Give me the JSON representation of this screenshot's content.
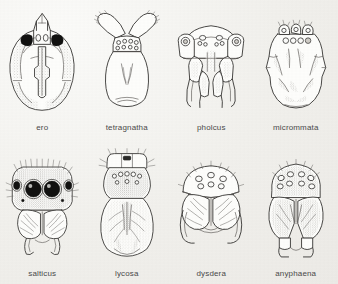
{
  "plate": {
    "title": "Spider carapace frontal views",
    "background_color": "#f2f1ee",
    "ink_color": "#3b3a38",
    "caption_color": "#4a4a4a",
    "columns": 4,
    "rows": 2
  },
  "specimens": [
    {
      "id": "ero",
      "label": "ero",
      "row": 1,
      "column": 1,
      "view": "frontal carapace",
      "eye_marking": "two solid black lateral eye patches flanking four pale central eyes",
      "shading": "stippled lateral margins and median band"
    },
    {
      "id": "tetragnatha",
      "label": "tetragnatha",
      "row": 1,
      "column": 2,
      "view": "frontal carapace with chelicerae",
      "eye_marking": "eight small open circular eyes in two rows",
      "shading": "clean outline, faint median lines"
    },
    {
      "id": "pholcus",
      "label": "pholcus",
      "row": 1,
      "column": 3,
      "view": "frontal carapace with long fangs",
      "eye_marking": "paired raised eye turrets with grouped circles",
      "shading": "light stipple on fangs and clypeus"
    },
    {
      "id": "micrommata",
      "label": "micrommata",
      "row": 1,
      "column": 4,
      "view": "frontal carapace",
      "eye_marking": "four open eyes in a row beneath four raised eyes",
      "shading": "heavy stippled radiating patches"
    },
    {
      "id": "salticus",
      "label": "salticus",
      "row": 2,
      "column": 1,
      "view": "frontal carapace, jumping spider",
      "eye_marking": "two huge black anterior median eyes flanked by two smaller dark lateral eyes",
      "shading": "dense stipple with bristle hairs along margin"
    },
    {
      "id": "lycosa",
      "label": "lycosa",
      "row": 2,
      "column": 2,
      "view": "frontal carapace, wolf spider",
      "eye_marking": "row of small eyes above a stippled eye field",
      "shading": "dense stipple over whole body with radiating striae"
    },
    {
      "id": "dysdera",
      "label": "dysdera",
      "row": 2,
      "column": 3,
      "view": "frontal carapace with large curved fangs",
      "eye_marking": "six open circular eyes in an arc",
      "shading": "light outline with faint striae"
    },
    {
      "id": "anyphaena",
      "label": "anyphaena",
      "row": 2,
      "column": 4,
      "view": "frontal carapace",
      "eye_marking": "eight open eyes in two rows across the crown",
      "shading": "stippled cheliceral faces and crown"
    }
  ]
}
